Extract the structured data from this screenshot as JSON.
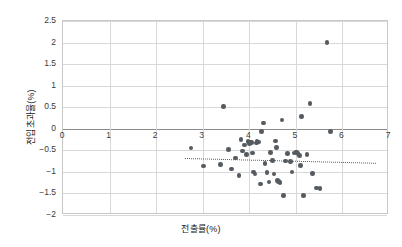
{
  "chart_data": {
    "type": "scatter",
    "title": "",
    "xlabel": "전출률(%)",
    "ylabel": "전입초과율(%)",
    "xlim": [
      0,
      7
    ],
    "ylim": [
      -2,
      2.5
    ],
    "xticks": [
      0,
      1,
      2,
      3,
      4,
      5,
      6,
      7
    ],
    "xtick_labels": [
      "0",
      "1",
      "2",
      "3",
      "4",
      "5",
      "6",
      "7"
    ],
    "yticks": [
      -2,
      -1.5,
      -1,
      -0.5,
      0,
      0.5,
      1,
      1.5,
      2,
      2.5
    ],
    "ytick_labels": [
      "−2",
      "−1.5",
      "−1",
      "−0.5",
      "0",
      "0.5",
      "1",
      "1.5",
      "2",
      "2.5"
    ],
    "grid": true,
    "legend": null,
    "marker_color": "#555b60",
    "gridline_color": "#d8d8d8",
    "zero_line_color": "#8a8a8a",
    "trendline": {
      "style": "dotted",
      "color": "#55595e",
      "x_start": 2.63,
      "y_start": -0.67,
      "x_end": 6.72,
      "y_end": -0.78
    },
    "points": [
      {
        "x": 2.75,
        "y": -0.45
      },
      {
        "x": 3.02,
        "y": -0.86
      },
      {
        "x": 3.38,
        "y": -0.83
      },
      {
        "x": 3.45,
        "y": 0.52
      },
      {
        "x": 3.55,
        "y": -0.48
      },
      {
        "x": 3.62,
        "y": -0.93
      },
      {
        "x": 3.7,
        "y": -0.68
      },
      {
        "x": 3.78,
        "y": -1.08
      },
      {
        "x": 3.82,
        "y": -0.25
      },
      {
        "x": 3.86,
        "y": -0.52
      },
      {
        "x": 3.9,
        "y": -0.38
      },
      {
        "x": 3.94,
        "y": -0.6
      },
      {
        "x": 3.97,
        "y": -0.3
      },
      {
        "x": 4.0,
        "y": -0.34
      },
      {
        "x": 4.02,
        "y": -0.31
      },
      {
        "x": 4.05,
        "y": -0.32
      },
      {
        "x": 4.07,
        "y": -0.56
      },
      {
        "x": 4.09,
        "y": -1.0
      },
      {
        "x": 4.12,
        "y": -1.05
      },
      {
        "x": 4.15,
        "y": -0.33
      },
      {
        "x": 4.17,
        "y": -0.29
      },
      {
        "x": 4.2,
        "y": -0.31
      },
      {
        "x": 4.24,
        "y": -1.28
      },
      {
        "x": 4.26,
        "y": -0.07
      },
      {
        "x": 4.3,
        "y": 0.13
      },
      {
        "x": 4.34,
        "y": -0.8
      },
      {
        "x": 4.38,
        "y": -1.02
      },
      {
        "x": 4.42,
        "y": -1.23
      },
      {
        "x": 4.46,
        "y": -0.55
      },
      {
        "x": 4.5,
        "y": -0.74
      },
      {
        "x": 4.53,
        "y": -1.05
      },
      {
        "x": 4.56,
        "y": -0.28
      },
      {
        "x": 4.58,
        "y": -0.44
      },
      {
        "x": 4.6,
        "y": -1.2
      },
      {
        "x": 4.63,
        "y": -1.22
      },
      {
        "x": 4.66,
        "y": -1.24
      },
      {
        "x": 4.7,
        "y": 0.2
      },
      {
        "x": 4.74,
        "y": -1.55
      },
      {
        "x": 4.78,
        "y": -0.75
      },
      {
        "x": 4.82,
        "y": -0.58
      },
      {
        "x": 4.88,
        "y": -0.76
      },
      {
        "x": 4.92,
        "y": -1.0
      },
      {
        "x": 4.96,
        "y": -0.56
      },
      {
        "x": 5.0,
        "y": -0.55
      },
      {
        "x": 5.02,
        "y": -0.54
      },
      {
        "x": 5.05,
        "y": -0.57
      },
      {
        "x": 5.08,
        "y": -0.62
      },
      {
        "x": 5.1,
        "y": -0.85
      },
      {
        "x": 5.12,
        "y": 0.28
      },
      {
        "x": 5.16,
        "y": -1.55
      },
      {
        "x": 5.24,
        "y": -0.6
      },
      {
        "x": 5.3,
        "y": 0.58
      },
      {
        "x": 5.36,
        "y": -1.04
      },
      {
        "x": 5.44,
        "y": -1.37
      },
      {
        "x": 5.52,
        "y": -1.38
      },
      {
        "x": 5.67,
        "y": 2.0
      },
      {
        "x": 5.74,
        "y": -0.07
      }
    ]
  }
}
